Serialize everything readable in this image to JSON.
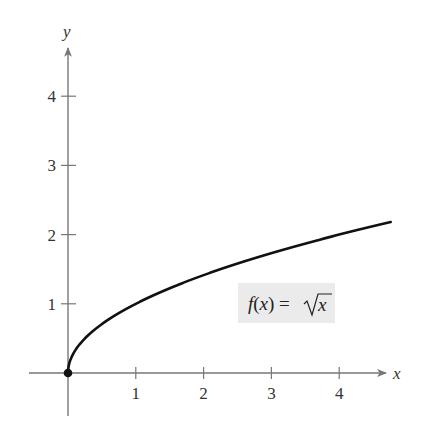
{
  "chart_data": {
    "type": "line",
    "title": "",
    "xlabel": "x",
    "ylabel": "y",
    "xlim": [
      -0.56,
      4.85
    ],
    "ylim": [
      -0.6,
      4.7
    ],
    "x_ticks": [
      1,
      2,
      3,
      4
    ],
    "y_ticks": [
      1,
      2,
      3,
      4
    ],
    "x_tick_labels": [
      "1",
      "2",
      "3",
      "4"
    ],
    "y_tick_labels": [
      "1",
      "2",
      "3",
      "4"
    ],
    "grid": false,
    "legend": null,
    "series": [
      {
        "name": "f(x) = √x",
        "function": "sqrt(x)",
        "x": [
          0,
          0.25,
          0.5,
          1,
          1.5,
          2,
          2.5,
          3,
          3.5,
          4,
          4.5,
          4.76
        ],
        "values": [
          0,
          0.5,
          0.707,
          1,
          1.225,
          1.414,
          1.581,
          1.732,
          1.871,
          2,
          2.121,
          2.182
        ]
      }
    ],
    "points": [
      {
        "x": 0,
        "y": 0,
        "style": "filled"
      }
    ],
    "annotations": [
      {
        "text_prefix": "f(x) = ",
        "text_radical": "x",
        "full_text": "f(x) = √x",
        "x": 3.0,
        "y": 1.0,
        "boxed": true,
        "box_color": "#ebebeb"
      }
    ],
    "colors": {
      "axis": "#777777",
      "curve": "#111111",
      "label_box": "#ebebeb"
    }
  }
}
